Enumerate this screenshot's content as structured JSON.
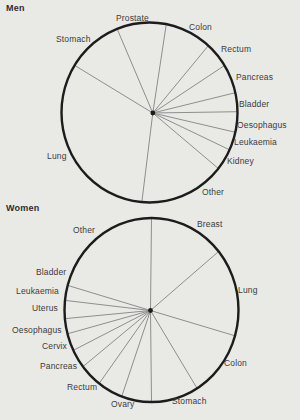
{
  "page": {
    "background_color": "#e9e9e6",
    "figure_type": "two pie charts of cancer sites, scanned print figure"
  },
  "colors": {
    "outline": "#1c1c1c",
    "boundary_line": "#8e8e8e",
    "hub_dot": "#1c1c1c",
    "label_text": "#3c3c3c",
    "title_text": "#2e2e2e"
  },
  "chart_data": [
    {
      "type": "pie",
      "title": "Men",
      "legend_position": "labels around circle",
      "geometry": {
        "cx": 149.5,
        "cy": 112.5,
        "rx": 88,
        "ry": 90,
        "hub_x": 152.8,
        "hub_y": 113,
        "outline_width": 2.4
      },
      "categories": [
        "Prostate",
        "Colon",
        "Rectum",
        "Pancreas",
        "Bladder",
        "Oesophagus",
        "Leukaemia",
        "Kidney",
        "Other",
        "Lung",
        "Stomach"
      ],
      "values": [
        9.1,
        8.6,
        4.6,
        5.2,
        3.4,
        3.7,
        3.3,
        3.9,
        15.7,
        32.4,
        10.2
      ],
      "value_unit": "percent (estimated from segment angles)",
      "slices": [
        {
          "label": "Prostate",
          "pct": 9.1,
          "start_deg": 111.6,
          "label_x": 116,
          "label_y": 13
        },
        {
          "label": "Colon",
          "pct": 8.6,
          "start_deg": 79,
          "label_x": 189,
          "label_y": 22
        },
        {
          "label": "Rectum",
          "pct": 4.6,
          "start_deg": 48,
          "label_x": 221,
          "label_y": 44
        },
        {
          "label": "Pancreas",
          "pct": 5.2,
          "start_deg": 31.5,
          "label_x": 236,
          "label_y": 72
        },
        {
          "label": "Bladder",
          "pct": 3.4,
          "start_deg": 12.7,
          "label_x": 239,
          "label_y": 99
        },
        {
          "label": "Oesophagus",
          "pct": 3.7,
          "start_deg": 0.5,
          "label_x": 237,
          "label_y": 120
        },
        {
          "label": "Leukaemia",
          "pct": 3.3,
          "start_deg": -12.7,
          "label_x": 234,
          "label_y": 137
        },
        {
          "label": "Kidney",
          "pct": 3.9,
          "start_deg": -24.5,
          "label_x": 227,
          "label_y": 156
        },
        {
          "label": "Other",
          "pct": 15.7,
          "start_deg": -38.5,
          "label_x": 202,
          "label_y": 187
        },
        {
          "label": "Lung",
          "pct": 32.4,
          "start_deg": -95,
          "label_x": 47,
          "label_y": 151
        },
        {
          "label": "Stomach",
          "pct": 10.2,
          "start_deg": 148.4,
          "label_x": 56,
          "label_y": 34
        }
      ]
    },
    {
      "type": "pie",
      "title": "Women",
      "legend_position": "labels around circle",
      "geometry": {
        "cx": 151.5,
        "cy": 310,
        "rx": 87,
        "ry": 92,
        "hub_x": 150.5,
        "hub_y": 310.5,
        "outline_width": 2.4
      },
      "categories": [
        "Breast",
        "Lung",
        "Colon",
        "Stomach",
        "Ovary",
        "Rectum",
        "Pancreas",
        "Cervix",
        "Oesophagus",
        "Uterus",
        "Leukaemia",
        "Bladder",
        "Other"
      ],
      "values": [
        14.0,
        15.5,
        11.7,
        8.8,
        5.6,
        4.7,
        4.2,
        3.3,
        3.1,
        2.7,
        3.2,
        2.6,
        20.7
      ],
      "value_unit": "percent (estimated from segment angles)",
      "slices": [
        {
          "label": "Breast",
          "pct": 14.0,
          "start_deg": 90,
          "label_x": 197,
          "label_y": 219
        },
        {
          "label": "Lung",
          "pct": 15.5,
          "start_deg": 39.5,
          "label_x": 238,
          "label_y": 285
        },
        {
          "label": "Colon",
          "pct": 11.7,
          "start_deg": -16.3,
          "label_x": 224,
          "label_y": 358
        },
        {
          "label": "Stomach",
          "pct": 8.8,
          "start_deg": -58.4,
          "label_x": 172,
          "label_y": 396
        },
        {
          "label": "Ovary",
          "pct": 5.6,
          "start_deg": -90,
          "label_x": 111,
          "label_y": 399
        },
        {
          "label": "Rectum",
          "pct": 4.7,
          "start_deg": -110,
          "label_x": 67,
          "label_y": 382
        },
        {
          "label": "Pancreas",
          "pct": 4.2,
          "start_deg": -127,
          "label_x": 40,
          "label_y": 361
        },
        {
          "label": "Cervix",
          "pct": 3.3,
          "start_deg": -142,
          "label_x": 42,
          "label_y": 341
        },
        {
          "label": "Oesophagus",
          "pct": 3.1,
          "start_deg": -154,
          "label_x": 12,
          "label_y": 325
        },
        {
          "label": "Uterus",
          "pct": 2.7,
          "start_deg": -165,
          "label_x": 32,
          "label_y": 303
        },
        {
          "label": "Leukaemia",
          "pct": 3.2,
          "start_deg": -174.6,
          "label_x": 16,
          "label_y": 286
        },
        {
          "label": "Bladder",
          "pct": 2.6,
          "start_deg": 174,
          "label_x": 36,
          "label_y": 267
        },
        {
          "label": "Other",
          "pct": 20.7,
          "start_deg": 164.5,
          "label_x": 73,
          "label_y": 225
        }
      ]
    }
  ]
}
